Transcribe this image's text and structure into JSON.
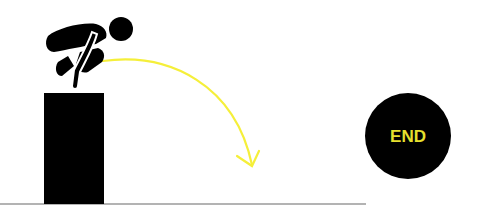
{
  "diagram": {
    "end_label": "END",
    "colors": {
      "background": "#ffffff",
      "figure": "#000000",
      "trajectory": "#f5ef3a",
      "end_text": "#e6e02e",
      "ground": "#9a9a9a"
    },
    "elements": [
      "jumper-figure",
      "platform-box",
      "trajectory-arrow",
      "end-circle",
      "ground-line"
    ]
  }
}
